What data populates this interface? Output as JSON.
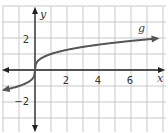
{
  "chart_data": {
    "type": "line",
    "title": "",
    "function": "cube root",
    "curve_label": "g",
    "xlabel": "x",
    "ylabel": "y",
    "xlim": [
      -2,
      8
    ],
    "ylim": [
      -4,
      4
    ],
    "grid": true,
    "grid_step": 1,
    "x_ticks": [
      {
        "value": 2,
        "label": "2"
      },
      {
        "value": 4,
        "label": "4"
      },
      {
        "value": 6,
        "label": "6"
      }
    ],
    "y_ticks": [
      {
        "value": 2,
        "label": "2"
      },
      {
        "value": -2,
        "label": "−2"
      }
    ],
    "series": [
      {
        "name": "g",
        "x": [
          -1.9,
          -1,
          -0.5,
          -0.1,
          0,
          0.1,
          0.5,
          1,
          2,
          4,
          6,
          7.6
        ],
        "y": [
          -1.24,
          -1,
          -0.79,
          -0.46,
          0,
          0.46,
          0.79,
          1,
          1.26,
          1.59,
          1.82,
          1.97
        ]
      }
    ],
    "colors": {
      "curve": "#555555",
      "axis": "#222222",
      "grid": "#c8c8c8"
    }
  }
}
